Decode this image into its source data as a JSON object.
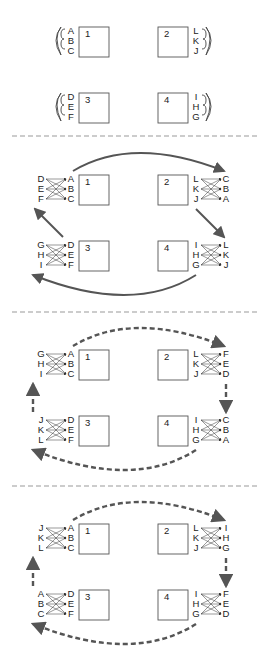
{
  "diagram": {
    "panels": [
      {
        "id": "initial",
        "boxes": [
          {
            "number": "1",
            "labels": [
              "A",
              "B",
              "C"
            ],
            "side": "left"
          },
          {
            "number": "2",
            "labels": [
              "L",
              "K",
              "J"
            ],
            "side": "right"
          },
          {
            "number": "3",
            "labels": [
              "D",
              "E",
              "F"
            ],
            "side": "left"
          },
          {
            "number": "4",
            "labels": [
              "I",
              "H",
              "G"
            ],
            "side": "right"
          }
        ]
      },
      {
        "id": "round-1",
        "arrow_style": "solid",
        "boxes": [
          {
            "number": "1",
            "inner": [
              "A",
              "B",
              "C"
            ],
            "outer": [
              "D",
              "E",
              "F"
            ]
          },
          {
            "number": "2",
            "inner": [
              "L",
              "K",
              "J"
            ],
            "outer": [
              "C",
              "B",
              "A"
            ]
          },
          {
            "number": "3",
            "inner": [
              "D",
              "E",
              "F"
            ],
            "outer": [
              "G",
              "H",
              "I"
            ]
          },
          {
            "number": "4",
            "inner": [
              "I",
              "H",
              "G"
            ],
            "outer": [
              "L",
              "K",
              "J"
            ]
          }
        ]
      },
      {
        "id": "round-2",
        "arrow_style": "dashed",
        "boxes": [
          {
            "number": "1",
            "inner": [
              "A",
              "B",
              "C"
            ],
            "outer": [
              "G",
              "H",
              "I"
            ]
          },
          {
            "number": "2",
            "inner": [
              "L",
              "K",
              "J"
            ],
            "outer": [
              "F",
              "E",
              "D"
            ]
          },
          {
            "number": "3",
            "inner": [
              "D",
              "E",
              "F"
            ],
            "outer": [
              "J",
              "K",
              "L"
            ]
          },
          {
            "number": "4",
            "inner": [
              "I",
              "H",
              "G"
            ],
            "outer": [
              "C",
              "B",
              "A"
            ]
          }
        ]
      },
      {
        "id": "round-3",
        "arrow_style": "dashed",
        "boxes": [
          {
            "number": "1",
            "inner": [
              "A",
              "B",
              "C"
            ],
            "outer": [
              "J",
              "K",
              "L"
            ]
          },
          {
            "number": "2",
            "inner": [
              "L",
              "K",
              "J"
            ],
            "outer": [
              "I",
              "H",
              "G"
            ]
          },
          {
            "number": "3",
            "inner": [
              "D",
              "E",
              "F"
            ],
            "outer": [
              "A",
              "B",
              "C"
            ]
          },
          {
            "number": "4",
            "inner": [
              "I",
              "H",
              "G"
            ],
            "outer": [
              "F",
              "E",
              "D"
            ]
          }
        ]
      }
    ],
    "colors": {
      "line": "#555555",
      "text": "#222222",
      "divider": "#999999"
    }
  }
}
